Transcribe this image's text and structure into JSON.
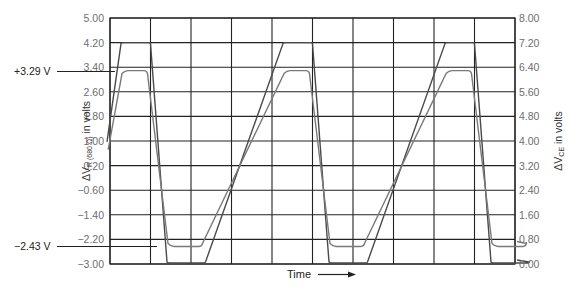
{
  "chart_data": {
    "type": "line",
    "title": "",
    "xlabel": "Time",
    "ylabel": "ΔV_R (680 Ω) in volts",
    "ylabel_right": "ΔV_CE in volts",
    "ylim": [
      -3.0,
      5.0
    ],
    "ylim_right": [
      0.0,
      8.0
    ],
    "grid": true,
    "y_ticks": [
      "5.00",
      "4.20",
      "3.40",
      "2.60",
      "1.80",
      "1.00",
      "0.20",
      "-0.60",
      "-1.40",
      "-2.20",
      "-3.00"
    ],
    "y_ticks_right": [
      "8.00",
      "7.20",
      "6.40",
      "5.60",
      "4.80",
      "4.00",
      "3.20",
      "2.40",
      "1.60",
      "0.80",
      "0.00"
    ],
    "x_divisions": 10,
    "annotations": [
      {
        "label": "+3.29 V",
        "y": 3.29
      },
      {
        "label": "−2.43 V",
        "y": -2.43
      }
    ],
    "series": [
      {
        "name": "ΔV_R (680 Ω)",
        "axis": "left",
        "shape": "trapezoidal square wave",
        "high": 3.29,
        "low": -2.43,
        "color": "#7a7a7a"
      },
      {
        "name": "ΔV_CE",
        "axis": "right",
        "shape": "trapezoidal square wave",
        "high": 7.2,
        "low": 0.0,
        "color": "#555555"
      }
    ],
    "period_divisions": 4
  },
  "labels": {
    "left_axis_prefix": "ΔV",
    "left_axis_sub": "R (680 Ω)",
    "left_axis_suffix": " in volts",
    "right_axis_prefix": "ΔV",
    "right_axis_sub": "CE",
    "right_axis_suffix": " in volts",
    "time": "Time",
    "ann_high": "+3.29 V",
    "ann_low": "−2.43 V"
  },
  "colors": {
    "grid": "#222222",
    "vr_trace": "#7a7a7a",
    "vce_trace": "#4a4a4a",
    "tick_text": "#6e6e6e"
  }
}
